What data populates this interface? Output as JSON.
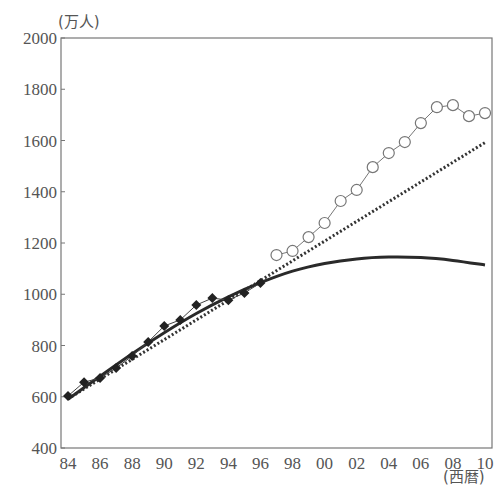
{
  "chart_data": {
    "type": "line",
    "title": "",
    "ylabel": "(万人)",
    "xlabel": "(西暦)",
    "ylim": [
      400,
      2000
    ],
    "yticks": [
      400,
      600,
      800,
      1000,
      1200,
      1400,
      1600,
      1800,
      2000
    ],
    "xlim": [
      1984,
      2010
    ],
    "xtick_labels": [
      "84",
      "86",
      "88",
      "90",
      "92",
      "94",
      "96",
      "98",
      "00",
      "02",
      "04",
      "06",
      "08",
      "10"
    ],
    "xtick_years": [
      1984,
      1986,
      1988,
      1990,
      1992,
      1994,
      1996,
      1998,
      2000,
      2002,
      2004,
      2006,
      2008,
      2010
    ],
    "grid": false,
    "legend": null,
    "series": [
      {
        "name": "actual (filled diamonds)",
        "marker": "diamond-filled",
        "x": [
          1984,
          1985,
          1986,
          1987,
          1988,
          1989,
          1990,
          1991,
          1992,
          1993,
          1994,
          1995,
          1996
        ],
        "values": [
          603,
          657,
          673,
          712,
          759,
          814,
          876,
          900,
          958,
          985,
          977,
          1005,
          1044
        ]
      },
      {
        "name": "actual (open circles)",
        "marker": "circle-open",
        "x": [
          1997,
          1998,
          1999,
          2000,
          2001,
          2002,
          2003,
          2004,
          2005,
          2006,
          2007,
          2008,
          2009,
          2010
        ],
        "values": [
          1153,
          1169,
          1223,
          1278,
          1364,
          1407,
          1496,
          1551,
          1594,
          1668,
          1730,
          1738,
          1695,
          1707
        ]
      },
      {
        "name": "linear trend (dotted)",
        "style": "dotted",
        "x": [
          1984,
          2010
        ],
        "values": [
          592,
          1592
        ]
      },
      {
        "name": "fitted curve (solid)",
        "style": "solid-thick",
        "x": [
          1984,
          1986,
          1988,
          1990,
          1992,
          1994,
          1996,
          1998,
          2000,
          2002,
          2004,
          2006,
          2008,
          2010
        ],
        "values": [
          590,
          680,
          768,
          850,
          925,
          990,
          1045,
          1090,
          1120,
          1138,
          1145,
          1143,
          1132,
          1114
        ]
      }
    ]
  }
}
